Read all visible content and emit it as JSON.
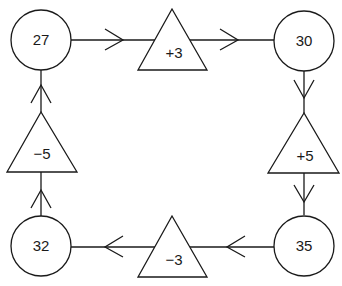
{
  "diagram": {
    "type": "flow-cycle",
    "colors": {
      "stroke": "#1a1a1a",
      "background": "#ffffff"
    },
    "nodes": [
      {
        "id": "n27",
        "shape": "circle",
        "label": "27"
      },
      {
        "id": "op_plus3",
        "shape": "triangle",
        "label": "+3"
      },
      {
        "id": "n30",
        "shape": "circle",
        "label": "30"
      },
      {
        "id": "op_plus5",
        "shape": "triangle",
        "label": "+5"
      },
      {
        "id": "n35",
        "shape": "circle",
        "label": "35"
      },
      {
        "id": "op_minus3",
        "shape": "triangle",
        "label": "−3"
      },
      {
        "id": "n32",
        "shape": "circle",
        "label": "32"
      },
      {
        "id": "op_minus5",
        "shape": "triangle",
        "label": "−5"
      }
    ],
    "edges": [
      {
        "from": "n27",
        "to": "op_plus3"
      },
      {
        "from": "op_plus3",
        "to": "n30"
      },
      {
        "from": "n30",
        "to": "op_plus5"
      },
      {
        "from": "op_plus5",
        "to": "n35"
      },
      {
        "from": "n35",
        "to": "op_minus3"
      },
      {
        "from": "op_minus3",
        "to": "n32"
      },
      {
        "from": "n32",
        "to": "op_minus5"
      },
      {
        "from": "op_minus5",
        "to": "n27"
      }
    ]
  }
}
